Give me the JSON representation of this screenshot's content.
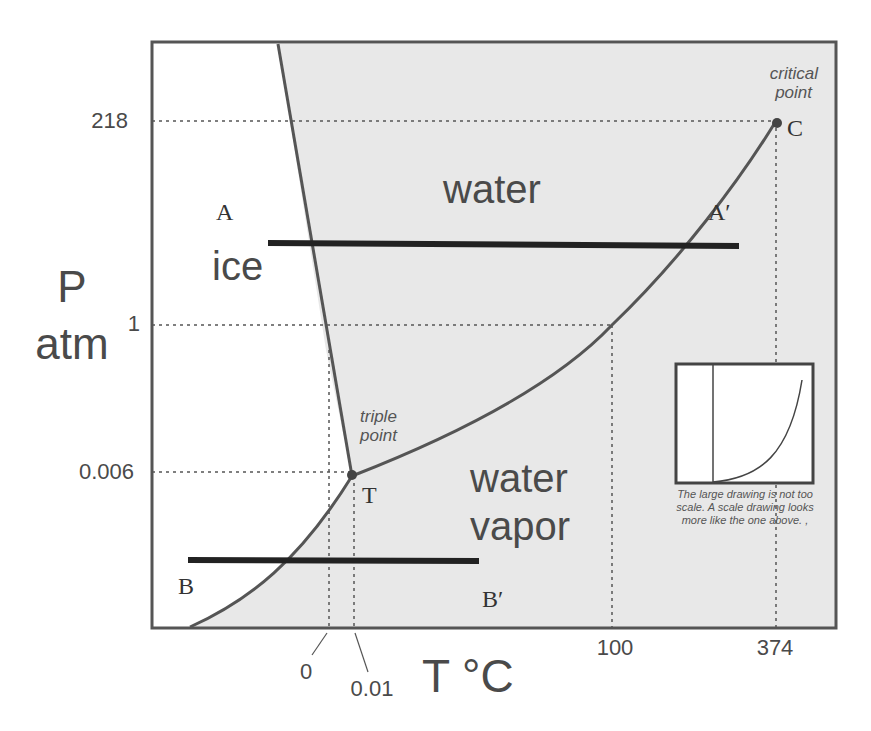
{
  "diagram": {
    "axes": {
      "y_label_line1": "P",
      "y_label_line2": "atm",
      "x_label": "T °C",
      "y_ticks": [
        "218",
        "1",
        "0.006"
      ],
      "x_ticks": [
        "0",
        "0.01",
        "100",
        "374"
      ]
    },
    "regions": {
      "ice": "ice",
      "water": "water",
      "vapor_line1": "water",
      "vapor_line2": "vapor"
    },
    "points": {
      "triple_label_line1": "triple",
      "triple_label_line2": "point",
      "triple_letter": "T",
      "critical_label_line1": "critical",
      "critical_label_line2": "point",
      "critical_letter": "C"
    },
    "paths": {
      "A": "A",
      "A_prime": "A′",
      "B": "B",
      "B_prime": "B′"
    },
    "inset": {
      "caption": "The large drawing is not too scale.  A scale drawing looks more like the one above. ,"
    },
    "colors": {
      "region_fill": "#e8e8e8",
      "curve": "#555555",
      "path_line": "#222222",
      "text": "#4a4a4a",
      "frame": "#555555"
    }
  }
}
